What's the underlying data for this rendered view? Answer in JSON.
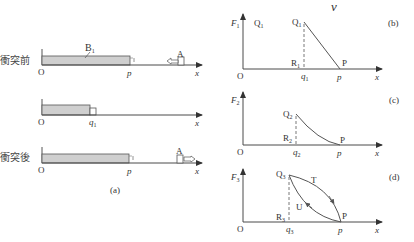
{
  "colors": {
    "line": "#4a4a4a",
    "bar_fill": "#cfcfcf",
    "text": "#333333",
    "background": "#ffffff"
  },
  "top_stray_label": "v",
  "panel_a": {
    "caption": "(a)",
    "rows": [
      {
        "label": "衝突前",
        "origin": "O",
        "bar_label": "B",
        "bar_label_sub": "1",
        "end_label": "p",
        "axis_label": "x",
        "object_label": "A",
        "object_arrow": "left-arrow-icon"
      },
      {
        "label": "",
        "origin": "O",
        "end_label": "q",
        "end_label_sub": "1",
        "axis_label": "x"
      },
      {
        "label": "衝突後",
        "origin": "O",
        "end_label": "p",
        "axis_label": "x",
        "object_label": "A",
        "object_arrow": "right-arrow-icon"
      }
    ]
  },
  "panel_b": {
    "caption": "(b)",
    "y_axis": "F",
    "y_axis_sub": "1",
    "corner_label": "Q",
    "corner_label_sub": "1",
    "origin": "O",
    "x_axis": "x",
    "point_top": "Q",
    "point_top_sub": "1",
    "point_foot": "R",
    "point_foot_sub": "1",
    "point_end": "P",
    "tick_q": "q",
    "tick_q_sub": "1",
    "tick_p": "p",
    "curve": "straight line Q1 to P"
  },
  "panel_c": {
    "caption": "(c)",
    "y_axis": "F",
    "y_axis_sub": "2",
    "origin": "O",
    "x_axis": "x",
    "point_top": "Q",
    "point_top_sub": "2",
    "point_foot": "R",
    "point_foot_sub": "2",
    "point_end": "P",
    "tick_q": "q",
    "tick_q_sub": "2",
    "tick_p": "p",
    "curve": "concave curve Q2 to P"
  },
  "panel_d": {
    "caption": "(d)",
    "y_axis": "F",
    "y_axis_sub": "3",
    "origin": "O",
    "x_axis": "x",
    "point_top": "Q",
    "point_top_sub": "3",
    "point_foot": "R",
    "point_foot_sub": "3",
    "point_end": "P",
    "tick_q": "q",
    "tick_q_sub": "3",
    "tick_p": "p",
    "curve_upper_label": "T",
    "curve_lower_label": "U",
    "curve": "hysteresis loop: T (upper, P to Q3 direction arrow toward P) and U (lower, arrow toward Q3)"
  }
}
